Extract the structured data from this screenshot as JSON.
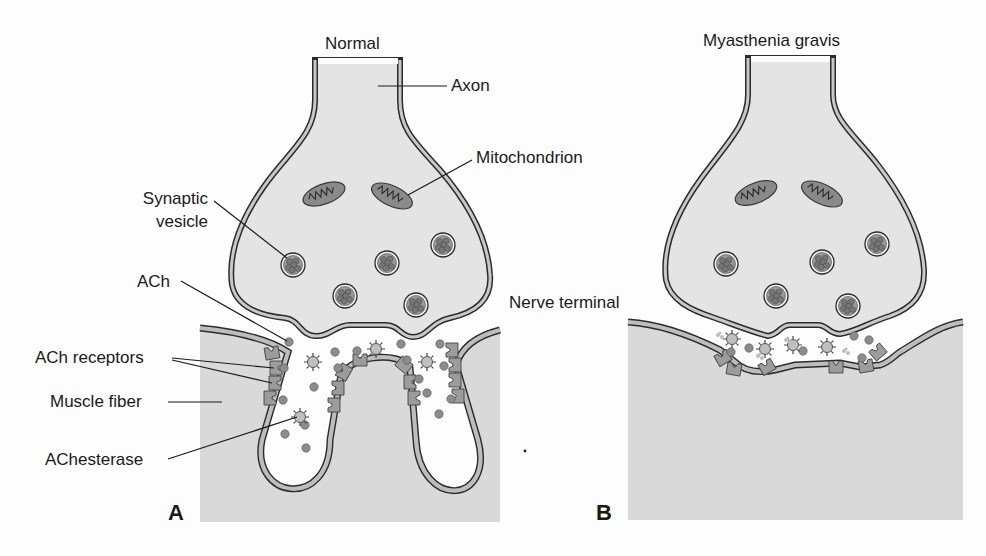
{
  "figure": {
    "panels": [
      {
        "id": "A",
        "letter": "A",
        "title": "Normal",
        "labels": {
          "axon": "Axon",
          "mitochondrion": "Mitochondrion",
          "synaptic_vesicle_line1": "Synaptic",
          "synaptic_vesicle_line2": "vesicle",
          "ach": "ACh",
          "ach_receptors": "ACh receptors",
          "muscle_fiber": "Muscle fiber",
          "achesterase": "AChesterase"
        }
      },
      {
        "id": "B",
        "letter": "B",
        "title": "Myasthenia gravis",
        "labels": {
          "nerve_terminal": "Nerve terminal"
        }
      }
    ],
    "colors": {
      "background": "#fdfdfd",
      "cytoplasm_fill": "#e4e4e4",
      "muscle_fill": "#d9d9d9",
      "membrane_fill": "#bdbdbd",
      "outline": "#2b2b2b",
      "mitochondrion_fill": "#8a8a8a",
      "vesicle_content": "#7a7a7a",
      "receptor_fill": "#9c9c9c",
      "ach_dot": "#8c8c8c"
    }
  }
}
